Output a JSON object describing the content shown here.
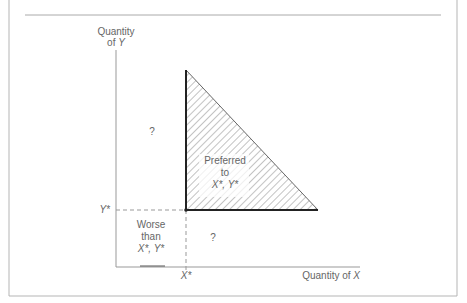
{
  "diagram": {
    "type": "indifference-preference-regions",
    "y_axis_label_line1": "Quantity",
    "y_axis_label_line2_prefix": "of ",
    "y_axis_label_line2_var": "Y",
    "x_axis_label_prefix": "Quantity of ",
    "x_axis_label_var": "X",
    "x_star_label": "X*",
    "y_star_label": "Y*",
    "region_upper_left": "?",
    "region_lower_right": "?",
    "region_preferred": {
      "line1": "Preferred",
      "line2": "to",
      "line3": "X*, Y*"
    },
    "region_worse": {
      "line1": "Worse",
      "line2": "than",
      "line3": "X*, Y*"
    },
    "colors": {
      "frame": "#b0b0b0",
      "axis": "#8a8a8a",
      "bold_edge": "#222222",
      "hatch": "#555555",
      "text": "#666666"
    }
  }
}
